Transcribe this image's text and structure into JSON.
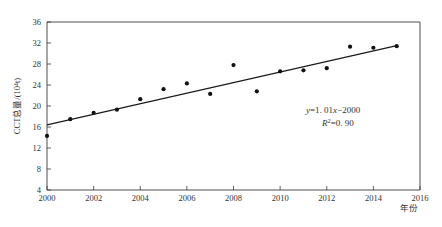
{
  "chart_data": {
    "type": "scatter",
    "title": "",
    "xlabel": "年份",
    "ylabel": "CCT总量/(10⁴t)",
    "x": [
      2000,
      2001,
      2002,
      2003,
      2004,
      2005,
      2006,
      2007,
      2008,
      2009,
      2010,
      2011,
      2012,
      2013,
      2014,
      2015
    ],
    "values": [
      14.3,
      17.5,
      18.7,
      19.3,
      21.3,
      23.2,
      24.3,
      22.3,
      27.8,
      22.8,
      26.6,
      26.8,
      27.2,
      31.3,
      31.1,
      31.4
    ],
    "xlim": [
      2000,
      2016
    ],
    "ylim": [
      4,
      36
    ],
    "xticks": [
      2000,
      2002,
      2004,
      2006,
      2008,
      2010,
      2012,
      2014,
      2016
    ],
    "xtick_labels": [
      "2000",
      "2002",
      "2004",
      "2006",
      "2008",
      "2010",
      "2012",
      "2014",
      "2016"
    ],
    "yticks": [
      4,
      8,
      12,
      16,
      20,
      24,
      28,
      32,
      36
    ],
    "ytick_labels": [
      "4",
      "8",
      "12",
      "16",
      "20",
      "24",
      "28",
      "32",
      "36"
    ],
    "grid": false,
    "legend": null,
    "trendline": {
      "slope": 1.01,
      "intercept_year_form": -2000,
      "y_at_2000": 16.4,
      "y_at_2015": 31.5
    },
    "annotations": {
      "equation": "y=1. 01x−2000",
      "equation_parts": {
        "y": "y",
        "eq1": "=1. 01",
        "x": "x",
        "rest": "−2000"
      },
      "r_squared": "R²=0. 90",
      "r_squared_parts": {
        "R": "R",
        "sup": "2",
        "value": "=0. 90"
      }
    },
    "marker": "filled-circle",
    "marker_color": "#111111",
    "line_color": "#1a1a1a",
    "axis_color": "#3a3a3a",
    "background": "#ffffff"
  }
}
